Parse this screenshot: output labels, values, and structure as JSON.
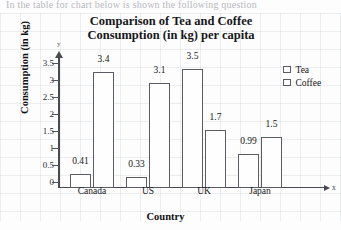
{
  "top_text_fragment": "In the table for chart below is shown the following question",
  "chart_data": {
    "type": "bar",
    "title": "Comparison of Tea and Coffee Consumption (in kg) per capita",
    "title_lines": [
      "Comparison of Tea and Coffee",
      "Consumption (in kg) per capita"
    ],
    "xlabel": "Country",
    "ylabel": "Consumption (in kg)",
    "x_axis_letter": "x",
    "y_axis_letter": "y",
    "categories": [
      "Canada",
      "US",
      "UK",
      "Japan"
    ],
    "series": [
      {
        "name": "Tea",
        "values": [
          0.41,
          0.33,
          3.5,
          0.99
        ],
        "labels": [
          "0.41",
          "0.33",
          "3.5",
          "0.99"
        ],
        "color": "#fefefe",
        "border": "#5b5b63"
      },
      {
        "name": "Coffee",
        "values": [
          3.4,
          3.1,
          1.7,
          1.5
        ],
        "labels": [
          "3.4",
          "3.1",
          "1.7",
          "1.5"
        ],
        "color": "#fefefe",
        "border": "#5b5b63"
      }
    ],
    "ylim": [
      0,
      3.5
    ],
    "yticks": [
      0,
      0.5,
      1,
      1.5,
      2,
      2.5,
      3,
      3.5
    ],
    "ytick_labels": [
      "0",
      "0.5",
      "1",
      "1.5",
      "2",
      "2.5",
      "3",
      "3.5"
    ],
    "grid": true,
    "legend_position": "right",
    "legend_entries": [
      "Tea",
      "Coffee"
    ]
  }
}
